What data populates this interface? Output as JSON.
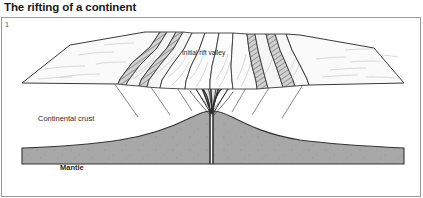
{
  "figure": {
    "title": "The rifting of a continent",
    "number": "1",
    "labels": {
      "rift_valley": "Initial rift valley",
      "continental_crust": "Continental crust",
      "mantle": "Mantle"
    },
    "colors": {
      "background": "#ffffff",
      "outline": "#3a3a3a",
      "top_surface": "#fafafa",
      "front_face": "#ffffff",
      "mantle_fill": "#a8a8a8",
      "magma_fill": "#d8d8d8",
      "scarp_fill": "#c9c9c9",
      "title_text": "#1a1a1a",
      "border": "#9a9a9a"
    },
    "elements": {
      "block_diagram": "3d-block-diagram",
      "graben": "central-graben-blocks",
      "fault_scarps_left": "stepped-fault-scarps-left",
      "fault_scarps_right": "stepped-fault-scarps-right",
      "magma_conduit": "magma-conduit",
      "mantle_dome": "mantle-upwelling-dome",
      "dike_swarm": "dike-swarm-lines"
    }
  }
}
